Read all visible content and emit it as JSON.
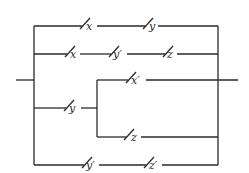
{
  "diagram": {
    "type": "switching-circuit",
    "branches": [
      {
        "name": "branch-1",
        "switches": [
          "x",
          "y"
        ]
      },
      {
        "name": "branch-2",
        "switches": [
          "x",
          "y'",
          "z"
        ]
      },
      {
        "name": "branch-3",
        "switches": [
          "y"
        ],
        "sub_branches": [
          {
            "name": "branch-3a",
            "switches": [
              "x'"
            ]
          },
          {
            "name": "branch-3b",
            "switches": [
              "z"
            ]
          }
        ]
      },
      {
        "name": "branch-4",
        "switches": [
          "y'",
          "z'"
        ]
      }
    ]
  },
  "labels": {
    "b1s1": "x",
    "b1s2": "y",
    "b2s1": "x",
    "b2s2": "y′",
    "b2s3": "z",
    "b3s1": "y",
    "b3as1": "x′",
    "b3bs1": "z",
    "b4s1": "y′",
    "b4s2": "z′"
  }
}
